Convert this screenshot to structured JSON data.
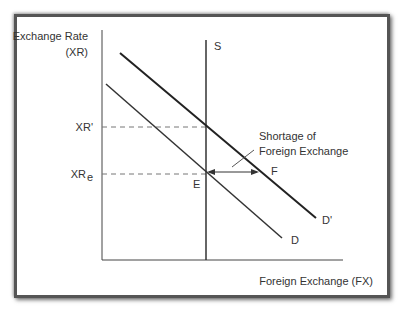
{
  "diagram": {
    "y_axis_label_line1": "Exchange Rate",
    "y_axis_label_line2": "(XR)",
    "x_axis_label": "Foreign Exchange (FX)",
    "supply_label": "S",
    "demand_label": "D",
    "demand_shifted_label": "D'",
    "xr_prime_label": "XR'",
    "xr_e_label": "XR",
    "xr_e_subscript": "e",
    "equilibrium_label": "E",
    "point_f_label": "F",
    "annotation_line1": "Shortage of",
    "annotation_line2": "Foreign Exchange"
  }
}
